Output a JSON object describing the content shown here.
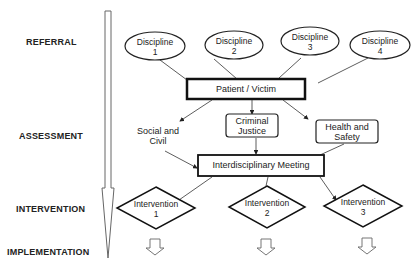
{
  "stages": [
    {
      "label": "REFERRAL"
    },
    {
      "label": "ASSESSMENT"
    },
    {
      "label": "INTERVENTION"
    },
    {
      "label": "IMPLEMENTATION"
    }
  ],
  "disciplines": [
    {
      "line1": "Discipline",
      "line2": "1"
    },
    {
      "line1": "Discipline",
      "line2": "2"
    },
    {
      "line1": "Discipline",
      "line2": "3"
    },
    {
      "line1": "Discipline",
      "line2": "4"
    }
  ],
  "patient_box": {
    "label": "Patient / Victim"
  },
  "assessment_areas": [
    {
      "line1": "Social and",
      "line2": "Civil"
    },
    {
      "line1": "Criminal",
      "line2": "Justice"
    },
    {
      "line1": "Health and",
      "line2": "Safety"
    }
  ],
  "meeting_box": {
    "label": "Interdisciplinary Meeting"
  },
  "interventions": [
    {
      "line1": "Intervention",
      "line2": "1"
    },
    {
      "line1": "Intervention",
      "line2": "2"
    },
    {
      "line1": "Intervention",
      "line2": "3"
    }
  ],
  "colors": {
    "stroke": "#222222",
    "background": "#ffffff",
    "arrow_outline": "#555555"
  }
}
